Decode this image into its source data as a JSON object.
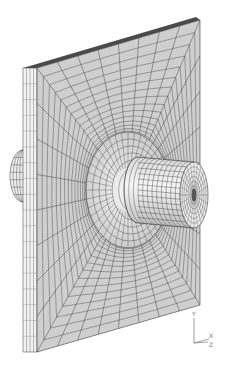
{
  "figure": {
    "type": "finite-element-mesh",
    "colors": {
      "background": "#ffffff",
      "plate_face": "#cfcfcf",
      "plate_edge_top": "#4a4a4a",
      "plate_side": "#f2f2f2",
      "mesh_line": "#3a3a3a",
      "boss_face": "#e6e6e6",
      "pin_face": "#ececec",
      "pin_hole": "#555555"
    },
    "plate": {
      "front_corners": [
        [
          37,
          68
        ],
        [
          200,
          20
        ],
        [
          200,
          305
        ],
        [
          37,
          352
        ]
      ],
      "side_offset_x": -14,
      "side_divisions": 4
    },
    "hub": {
      "center": [
        128,
        190
      ],
      "rx": 42,
      "ry": 58
    },
    "pin": {
      "base_center": [
        138,
        190
      ],
      "end_center": [
        194,
        195
      ],
      "rx": 14,
      "ry": 33
    },
    "back_pin": {
      "center": [
        23,
        176
      ],
      "rx": 13,
      "ry": 26
    },
    "mesh": {
      "radial_lines": 32,
      "rings": 14
    }
  },
  "triad": {
    "labels": {
      "y": "Y",
      "x": "X",
      "z": "Z"
    },
    "origin": [
      194,
      343
    ]
  }
}
